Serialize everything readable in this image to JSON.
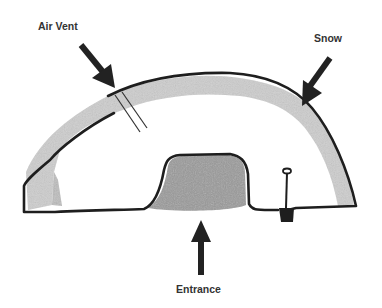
{
  "diagram": {
    "labels": {
      "air_vent": "Air Vent",
      "snow": "Snow",
      "entrance": "Entrance"
    },
    "colors": {
      "outline": "#1e1e1e",
      "snow_fill": "#c8c8c8",
      "entrance_fill": "#9a9a9a",
      "arrow": "#222222",
      "label": "#333333",
      "background": "#ffffff"
    },
    "icons": [
      "arrow-down-right-icon",
      "arrow-down-left-icon",
      "arrow-up-icon",
      "shovel-icon"
    ]
  }
}
